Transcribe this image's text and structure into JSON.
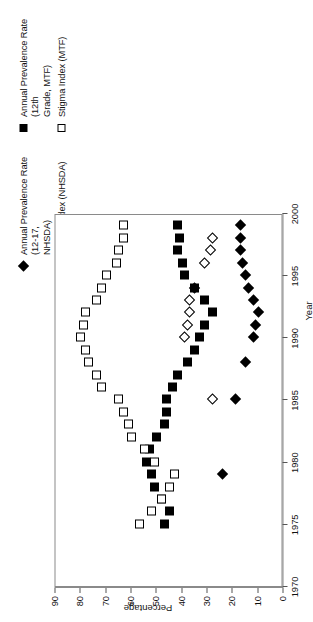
{
  "chart_data": {
    "type": "scatter",
    "title": "",
    "xlabel": "Year",
    "ylabel": "Percentage",
    "xlim": [
      1970,
      2000
    ],
    "ylim": [
      0,
      90
    ],
    "xticks": [
      1970,
      1975,
      1980,
      1985,
      1990,
      1995,
      2000
    ],
    "yticks": [
      0,
      10,
      20,
      30,
      40,
      50,
      60,
      70,
      80,
      90
    ],
    "grid": false,
    "legend_position": "top-right",
    "orientation_note": "figure rendered rotated 90 degrees counter-clockwise",
    "series": [
      {
        "name": "Annual Prevalence Rate (12-17, NHSDA)",
        "marker": "filled-diamond",
        "color": "#000000",
        "points": [
          {
            "x": 1979,
            "y": 24
          },
          {
            "x": 1985,
            "y": 19
          },
          {
            "x": 1988,
            "y": 15
          },
          {
            "x": 1990,
            "y": 12
          },
          {
            "x": 1991,
            "y": 11
          },
          {
            "x": 1992,
            "y": 10
          },
          {
            "x": 1993,
            "y": 12
          },
          {
            "x": 1994,
            "y": 14
          },
          {
            "x": 1995,
            "y": 15
          },
          {
            "x": 1996,
            "y": 16
          },
          {
            "x": 1997,
            "y": 17
          },
          {
            "x": 1998,
            "y": 17
          },
          {
            "x": 1999,
            "y": 17
          }
        ]
      },
      {
        "name": "Stigma Index (NHSDA)",
        "marker": "open-diamond",
        "color": "#000000",
        "points": [
          {
            "x": 1985,
            "y": 28
          },
          {
            "x": 1990,
            "y": 39
          },
          {
            "x": 1991,
            "y": 38
          },
          {
            "x": 1992,
            "y": 37
          },
          {
            "x": 1993,
            "y": 37
          },
          {
            "x": 1994,
            "y": 35
          },
          {
            "x": 1996,
            "y": 31
          },
          {
            "x": 1997,
            "y": 29
          },
          {
            "x": 1998,
            "y": 28
          }
        ]
      },
      {
        "name": "Annual Prevalence Rate (12th Grade, MTF)",
        "marker": "filled-square",
        "color": "#000000",
        "points": [
          {
            "x": 1975,
            "y": 47
          },
          {
            "x": 1976,
            "y": 45
          },
          {
            "x": 1977,
            "y": 48
          },
          {
            "x": 1978,
            "y": 51
          },
          {
            "x": 1979,
            "y": 52
          },
          {
            "x": 1980,
            "y": 54
          },
          {
            "x": 1981,
            "y": 53
          },
          {
            "x": 1982,
            "y": 50
          },
          {
            "x": 1983,
            "y": 47
          },
          {
            "x": 1984,
            "y": 46
          },
          {
            "x": 1985,
            "y": 46
          },
          {
            "x": 1986,
            "y": 44
          },
          {
            "x": 1987,
            "y": 42
          },
          {
            "x": 1988,
            "y": 38
          },
          {
            "x": 1989,
            "y": 35
          },
          {
            "x": 1990,
            "y": 33
          },
          {
            "x": 1991,
            "y": 31
          },
          {
            "x": 1992,
            "y": 28
          },
          {
            "x": 1993,
            "y": 31
          },
          {
            "x": 1994,
            "y": 35
          },
          {
            "x": 1995,
            "y": 39
          },
          {
            "x": 1996,
            "y": 40
          },
          {
            "x": 1997,
            "y": 42
          },
          {
            "x": 1998,
            "y": 41
          },
          {
            "x": 1999,
            "y": 42
          }
        ]
      },
      {
        "name": "Stigma Index (MTF)",
        "marker": "open-square",
        "color": "#000000",
        "points": [
          {
            "x": 1975,
            "y": 57
          },
          {
            "x": 1976,
            "y": 52
          },
          {
            "x": 1977,
            "y": 48
          },
          {
            "x": 1978,
            "y": 45
          },
          {
            "x": 1979,
            "y": 43
          },
          {
            "x": 1980,
            "y": 51
          },
          {
            "x": 1981,
            "y": 55
          },
          {
            "x": 1982,
            "y": 60
          },
          {
            "x": 1983,
            "y": 61
          },
          {
            "x": 1984,
            "y": 63
          },
          {
            "x": 1985,
            "y": 65
          },
          {
            "x": 1986,
            "y": 72
          },
          {
            "x": 1987,
            "y": 74
          },
          {
            "x": 1988,
            "y": 77
          },
          {
            "x": 1989,
            "y": 78
          },
          {
            "x": 1990,
            "y": 80
          },
          {
            "x": 1991,
            "y": 79
          },
          {
            "x": 1992,
            "y": 78
          },
          {
            "x": 1993,
            "y": 74
          },
          {
            "x": 1994,
            "y": 72
          },
          {
            "x": 1995,
            "y": 70
          },
          {
            "x": 1996,
            "y": 66
          },
          {
            "x": 1997,
            "y": 65
          },
          {
            "x": 1998,
            "y": 63
          },
          {
            "x": 1999,
            "y": 63
          }
        ]
      }
    ]
  },
  "legend": {
    "entries": [
      {
        "label": "Annual Prevalence Rate (12-17,\nNHSDA)",
        "marker": "filled-diamond"
      },
      {
        "label": "Stigma Index (NHSDA)",
        "marker": "open-diamond"
      },
      {
        "label": "Annual Prevalence Rate (12th\nGrade, MTF)",
        "marker": "filled-square"
      },
      {
        "label": "Stigma Index (MTF)",
        "marker": "open-square"
      }
    ]
  },
  "axes": {
    "x_title": "Year",
    "y_title": "Percentage",
    "x_tick_labels": [
      "1970",
      "1975",
      "1980",
      "1985",
      "1990",
      "1995",
      "2000"
    ],
    "y_tick_labels": [
      "0",
      "10",
      "20",
      "30",
      "40",
      "50",
      "60",
      "70",
      "80",
      "90"
    ]
  }
}
